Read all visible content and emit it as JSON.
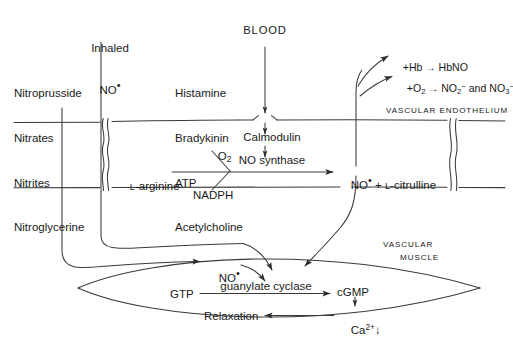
{
  "diagram": {
    "compartments": {
      "blood": "BLOOD",
      "endothelium": "VASCULAR ENDOTHELIUM",
      "muscle_line1": "VASCULAR",
      "muscle_line2": "MUSCLE"
    },
    "donors": {
      "line1": "Nitroprusside",
      "line2": "Nitrates",
      "line3": "Nitrites",
      "line4": "Nitroglycerine"
    },
    "inhaled": {
      "line1": "Inhaled",
      "line2": "NO",
      "radical": "•"
    },
    "agonists": {
      "line1": "Histamine",
      "line2": "Bradykinin",
      "line3": "ATP",
      "line4": "Acetylcholine"
    },
    "endothelial_reaction": {
      "substrate": "L-arginine",
      "substrate_small_cap": "L",
      "substrate_rest": "-arginine",
      "cofactor_top": "O",
      "cofactor_top_sub": "2",
      "cofactor_bottom": "NADPH",
      "regulator": "Calmodulin",
      "enzyme": "NO synthase",
      "product_no": "NO",
      "product_radical": "•",
      "product_plus": " + ",
      "product_citrulline_cap": "L",
      "product_citrulline_rest": "-citrulline"
    },
    "blood_fates": {
      "hb_prefix": "+Hb ",
      "hb_arrow": "→",
      "hb_product": " HbNO",
      "ox_prefix": "+O",
      "ox_sub": "2",
      "ox_arrow": " → ",
      "ox_product_1": "NO",
      "ox_product_1_sub": "2",
      "ox_product_1_charge": "−",
      "ox_conj": " and ",
      "ox_product_2": "NO",
      "ox_product_2_sub": "3",
      "ox_product_2_charge": "−"
    },
    "muscle_reaction": {
      "no_label": "NO",
      "no_radical": "•",
      "gtp": "GTP",
      "enzyme": "guanylate cyclase",
      "cgmp": "cGMP",
      "calcium": "Ca",
      "calcium_charge": "2+",
      "calcium_change": "↓",
      "relaxation": "Relaxation"
    }
  }
}
